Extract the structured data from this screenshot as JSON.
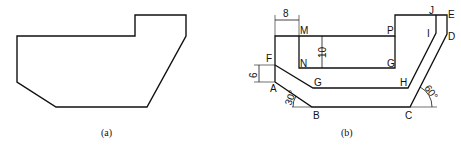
{
  "figure_a": {
    "caption": "(a)",
    "outline_points": "17,36 135,36 135,15 186,15 186,36 147,107 56,107 17,82"
  },
  "figure_b": {
    "caption": "(b)",
    "points": {
      "A": "A",
      "B": "B",
      "C": "C",
      "D": "D",
      "E": "E",
      "F": "F",
      "G1": "G",
      "G2": "G",
      "H": "H",
      "I": "I",
      "J": "J",
      "M": "M",
      "N": "N",
      "P": "P"
    },
    "dimensions": {
      "width_MN_offset": "8",
      "height_MN": "10",
      "height_AF": "6",
      "angle_AB": "30°",
      "angle_CD": "60°"
    }
  }
}
